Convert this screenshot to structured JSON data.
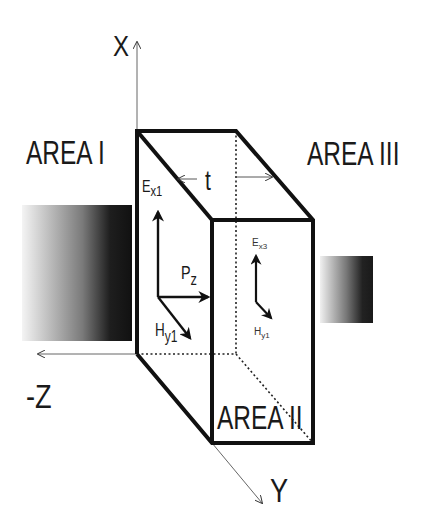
{
  "diagram": {
    "type": "3d-slab-field-diagram",
    "axes": {
      "x": {
        "label": "X"
      },
      "y": {
        "label": "Y"
      },
      "neg_z": {
        "label": "-Z"
      }
    },
    "regions": {
      "area1": {
        "label": "AREA I"
      },
      "area2": {
        "label": "AREA II"
      },
      "area3": {
        "label": "AREA III"
      }
    },
    "thickness": {
      "label": "t"
    },
    "vectors_area1": {
      "e_field": {
        "symbol": "E",
        "subscript": "x1"
      },
      "h_field": {
        "symbol": "H",
        "subscript": "y1"
      },
      "poynting": {
        "symbol": "P",
        "subscript": "z"
      }
    },
    "vectors_area3": {
      "e_field": {
        "symbol": "E",
        "subscript": "x3"
      },
      "h_field": {
        "symbol": "H",
        "subscript": "y1"
      }
    },
    "gradients": {
      "incident": {
        "from": "#f4f4f4",
        "to": "#111111"
      },
      "transmitted": {
        "from": "#f0f0f0",
        "to": "#1a1a1a"
      }
    }
  }
}
